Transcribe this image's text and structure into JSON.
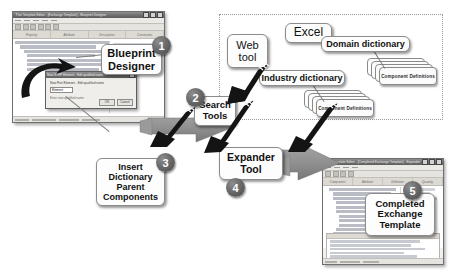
{
  "diagram": {
    "colors": {
      "badge_fill": "#5a5a5a",
      "gray_arrow": "#8e8e8e",
      "black_arrow": "#111111",
      "callout_border": "#8c8c8c",
      "panel_border": "#9a9a9a"
    }
  },
  "steps": [
    {
      "number": "1",
      "label": "Blueprint Designer"
    },
    {
      "number": "2",
      "label": "Search Tools"
    },
    {
      "number": "3",
      "label": "Insert Dictionary Parent Components"
    },
    {
      "number": "4",
      "label": "Expander Tool"
    },
    {
      "number": "5",
      "label": "Completed Exchange Template"
    }
  ],
  "callouts": {
    "blueprint_designer": {
      "line1": "Blueprint",
      "line2": "Designer"
    },
    "search_tools": {
      "line1": "Search",
      "line2": "Tools"
    },
    "insert_dictionary": {
      "line1": "Insert",
      "line2": "Dictionary",
      "line3": "Parent",
      "line4": "Components"
    },
    "expander_tool": {
      "line1": "Expander",
      "line2": "Tool"
    },
    "completed_template": {
      "line1": "Completed",
      "line2": "Exchange",
      "line3": "Template"
    }
  },
  "sources_panel": {
    "excel": "Excel",
    "web_tool": {
      "line1": "Web",
      "line2": "tool"
    },
    "domain_dictionary": "Domain dictionary",
    "industry_dictionary": "Industry dictionary",
    "component_definitions_domain": "Component Definitions",
    "component_definitions_industry": "Component Definitions"
  },
  "windows": {
    "blueprint_window": {
      "title": "Part Template Editor - [Exchange Template] - Blueprint Designer",
      "columns": [
        "Property",
        "Attribute",
        "Description",
        "Constraints"
      ],
      "dialog": {
        "title": "New STEP Element - Edit qualified name",
        "field_label": "New Part Element - Edit qualified name",
        "value": "Element",
        "hint": "Enter new qualified name",
        "ok_label": "OK",
        "cancel_label": "Cancel"
      },
      "status": "Ready"
    },
    "completed_window": {
      "title": "Part Template Editor - [Completed Exchange Template] - Expander Tool",
      "columns": [
        "Component",
        "Attribute",
        "Definition",
        "Quantity"
      ],
      "status": "Ready"
    }
  }
}
